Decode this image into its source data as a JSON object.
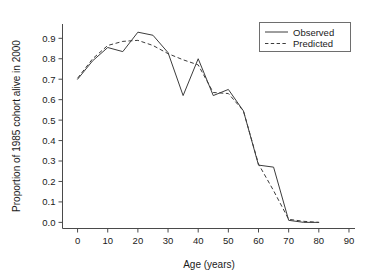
{
  "chart_data": {
    "type": "line",
    "title": "",
    "xlabel": "Age (years)",
    "ylabel": "Proportion of 1985 cohort alive in 2000",
    "xlim": [
      -5,
      92
    ],
    "ylim": [
      -0.03,
      0.97
    ],
    "xticks": [
      0,
      10,
      20,
      30,
      40,
      50,
      60,
      70,
      80,
      90
    ],
    "xtick_labels": [
      "0",
      "10",
      "20",
      "30",
      "40",
      "50",
      "60",
      "70",
      "80",
      "90"
    ],
    "yticks": [
      0.0,
      0.1,
      0.2,
      0.3,
      0.4,
      0.5,
      0.6,
      0.7,
      0.8,
      0.9
    ],
    "ytick_labels": [
      "0.0",
      "0.1",
      "0.2",
      "0.3",
      "0.4",
      "0.5",
      "0.6",
      "0.7",
      "0.8",
      "0.9"
    ],
    "grid": false,
    "legend_position": "top-right",
    "x": [
      0,
      5,
      10,
      15,
      20,
      25,
      30,
      35,
      40,
      45,
      50,
      55,
      60,
      65,
      70,
      75,
      80
    ],
    "series": [
      {
        "name": "Observed",
        "style": "solid",
        "color": "#3c3c3c",
        "values": [
          0.7,
          0.79,
          0.855,
          0.835,
          0.93,
          0.915,
          0.83,
          0.62,
          0.8,
          0.62,
          0.65,
          0.545,
          0.28,
          0.27,
          0.01,
          0.0,
          0.0
        ]
      },
      {
        "name": "Predicted",
        "style": "dashed",
        "color": "#3c3c3c",
        "values": [
          0.705,
          0.8,
          0.865,
          0.885,
          0.89,
          0.865,
          0.825,
          0.795,
          0.77,
          0.635,
          0.63,
          0.545,
          0.285,
          0.155,
          0.015,
          0.005,
          0.0
        ]
      }
    ],
    "legend": [
      {
        "label": "Observed",
        "style": "solid"
      },
      {
        "label": "Predicted",
        "style": "dashed"
      }
    ]
  }
}
